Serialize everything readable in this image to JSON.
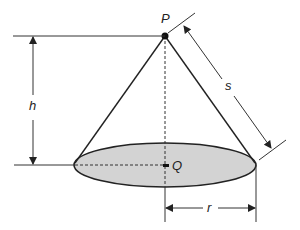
{
  "diagram": {
    "labels": {
      "apex": "P",
      "base_center": "Q",
      "height": "h",
      "slant_height": "s",
      "radius": "r"
    },
    "colors": {
      "stroke": "#222222",
      "base_fill": "#d3d3d3",
      "background": "#ffffff"
    }
  }
}
